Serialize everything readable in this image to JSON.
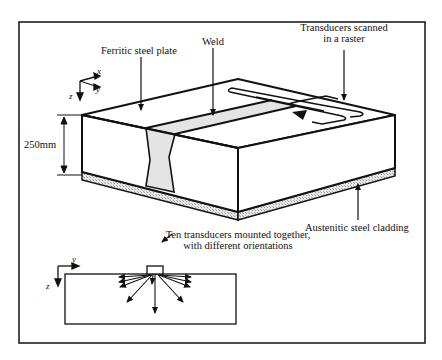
{
  "labels": {
    "ferritic_plate": "Ferritic steel plate",
    "weld": "Weld",
    "transducers_line1": "Transducers scanned",
    "transducers_line2": "in a raster",
    "thickness": "250mm",
    "cladding": "Austenitic steel cladding",
    "ten_line1": "Ten transducers mounted together,",
    "ten_line2": "with different orientations"
  },
  "axes_3d": {
    "x": "x",
    "y": "y",
    "z": "z"
  },
  "axes_2d": {
    "y": "y",
    "z": "z"
  },
  "colors": {
    "line": "#111111",
    "weld_fill": "#e4e4e4",
    "cladding_fill": "#cfcfcf"
  }
}
